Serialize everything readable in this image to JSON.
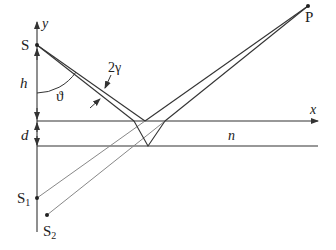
{
  "diagram": {
    "type": "optics-thin-film-interference",
    "labels": {
      "y_axis": "y",
      "x_axis": "x",
      "source": "S",
      "point": "P",
      "height": "h",
      "thickness": "d",
      "angle": "ϑ",
      "divergence": "2γ",
      "refractive_index": "n",
      "image1": "S",
      "image1_sub": "1",
      "image2": "S",
      "image2_sub": "2"
    },
    "colors": {
      "line": "#333333",
      "gray_line": "#888888",
      "background": "#ffffff"
    }
  }
}
